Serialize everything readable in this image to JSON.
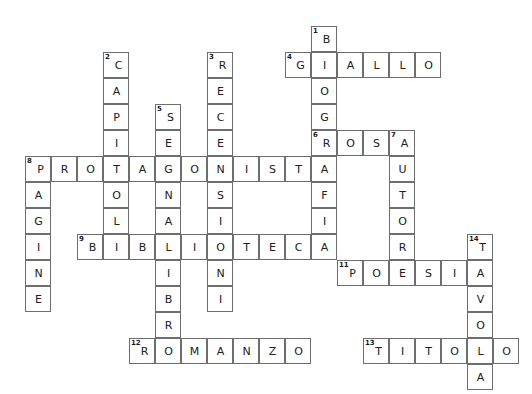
{
  "puzzle": {
    "kind": "crossword-grid",
    "title": "",
    "cell_size": 26,
    "origin_x": 25,
    "origin_y": 26,
    "cols": 19,
    "rows": 14,
    "colors": {
      "cell_background": "#ffffff",
      "cell_border": "#6e6e6e",
      "letter": "#202020",
      "clue_number": "#1a1a1a",
      "page_background": "#ffffff"
    },
    "entries": {
      "across": [
        {
          "number": "4",
          "answer": "GIALLO",
          "row": 1,
          "col": 10
        },
        {
          "number": "6",
          "answer": "ROSA",
          "row": 4,
          "col": 11
        },
        {
          "number": "8",
          "answer": "PROTAGONISTA",
          "row": 5,
          "col": 0
        },
        {
          "number": "9",
          "answer": "BIBLIOTECA",
          "row": 8,
          "col": 2
        },
        {
          "number": "11",
          "answer": "POESIA",
          "row": 9,
          "col": 12
        },
        {
          "number": "12",
          "answer": "ROMANZO",
          "row": 12,
          "col": 4
        },
        {
          "number": "13",
          "answer": "TITOLO",
          "row": 12,
          "col": 13
        }
      ],
      "down": [
        {
          "number": "1",
          "answer": "BIOGRAFIA",
          "row": 0,
          "col": 11
        },
        {
          "number": "2",
          "answer": "CAPITOLI",
          "row": 1,
          "col": 3
        },
        {
          "number": "3",
          "answer": "RECENSIONI",
          "row": 1,
          "col": 7
        },
        {
          "number": "5",
          "answer": "SEGNALIBRO",
          "row": 3,
          "col": 5
        },
        {
          "number": "7",
          "answer": "AUTORE",
          "row": 4,
          "col": 14
        },
        {
          "number": "8",
          "answer": "PAGINE",
          "row": 5,
          "col": 0
        },
        {
          "number": "14",
          "answer": "TAVOLA",
          "row": 8,
          "col": 17
        }
      ]
    },
    "cells": [
      {
        "row": 0,
        "col": 11,
        "letter": "B",
        "number": "1"
      },
      {
        "row": 1,
        "col": 3,
        "letter": "C",
        "number": "2"
      },
      {
        "row": 1,
        "col": 7,
        "letter": "R",
        "number": "3"
      },
      {
        "row": 1,
        "col": 10,
        "letter": "G",
        "number": "4"
      },
      {
        "row": 1,
        "col": 11,
        "letter": "I",
        "number": ""
      },
      {
        "row": 1,
        "col": 12,
        "letter": "A",
        "number": ""
      },
      {
        "row": 1,
        "col": 13,
        "letter": "L",
        "number": ""
      },
      {
        "row": 1,
        "col": 14,
        "letter": "L",
        "number": ""
      },
      {
        "row": 1,
        "col": 15,
        "letter": "O",
        "number": ""
      },
      {
        "row": 2,
        "col": 3,
        "letter": "A",
        "number": ""
      },
      {
        "row": 2,
        "col": 7,
        "letter": "E",
        "number": ""
      },
      {
        "row": 2,
        "col": 11,
        "letter": "O",
        "number": ""
      },
      {
        "row": 3,
        "col": 3,
        "letter": "P",
        "number": ""
      },
      {
        "row": 3,
        "col": 5,
        "letter": "S",
        "number": "5"
      },
      {
        "row": 3,
        "col": 7,
        "letter": "C",
        "number": ""
      },
      {
        "row": 3,
        "col": 11,
        "letter": "G",
        "number": ""
      },
      {
        "row": 4,
        "col": 3,
        "letter": "I",
        "number": ""
      },
      {
        "row": 4,
        "col": 5,
        "letter": "E",
        "number": ""
      },
      {
        "row": 4,
        "col": 7,
        "letter": "E",
        "number": ""
      },
      {
        "row": 4,
        "col": 11,
        "letter": "R",
        "number": "6"
      },
      {
        "row": 4,
        "col": 12,
        "letter": "O",
        "number": ""
      },
      {
        "row": 4,
        "col": 13,
        "letter": "S",
        "number": ""
      },
      {
        "row": 4,
        "col": 14,
        "letter": "A",
        "number": "7"
      },
      {
        "row": 5,
        "col": 0,
        "letter": "P",
        "number": "8"
      },
      {
        "row": 5,
        "col": 1,
        "letter": "R",
        "number": ""
      },
      {
        "row": 5,
        "col": 2,
        "letter": "O",
        "number": ""
      },
      {
        "row": 5,
        "col": 3,
        "letter": "T",
        "number": ""
      },
      {
        "row": 5,
        "col": 4,
        "letter": "A",
        "number": ""
      },
      {
        "row": 5,
        "col": 5,
        "letter": "G",
        "number": ""
      },
      {
        "row": 5,
        "col": 6,
        "letter": "O",
        "number": ""
      },
      {
        "row": 5,
        "col": 7,
        "letter": "N",
        "number": ""
      },
      {
        "row": 5,
        "col": 8,
        "letter": "I",
        "number": ""
      },
      {
        "row": 5,
        "col": 9,
        "letter": "S",
        "number": ""
      },
      {
        "row": 5,
        "col": 10,
        "letter": "T",
        "number": ""
      },
      {
        "row": 5,
        "col": 11,
        "letter": "A",
        "number": ""
      },
      {
        "row": 5,
        "col": 14,
        "letter": "U",
        "number": ""
      },
      {
        "row": 6,
        "col": 0,
        "letter": "A",
        "number": ""
      },
      {
        "row": 6,
        "col": 3,
        "letter": "O",
        "number": ""
      },
      {
        "row": 6,
        "col": 5,
        "letter": "N",
        "number": ""
      },
      {
        "row": 6,
        "col": 7,
        "letter": "S",
        "number": ""
      },
      {
        "row": 6,
        "col": 11,
        "letter": "F",
        "number": ""
      },
      {
        "row": 6,
        "col": 14,
        "letter": "T",
        "number": ""
      },
      {
        "row": 7,
        "col": 0,
        "letter": "G",
        "number": ""
      },
      {
        "row": 7,
        "col": 3,
        "letter": "L",
        "number": ""
      },
      {
        "row": 7,
        "col": 5,
        "letter": "A",
        "number": ""
      },
      {
        "row": 7,
        "col": 7,
        "letter": "I",
        "number": ""
      },
      {
        "row": 7,
        "col": 11,
        "letter": "I",
        "number": ""
      },
      {
        "row": 7,
        "col": 14,
        "letter": "O",
        "number": ""
      },
      {
        "row": 8,
        "col": 0,
        "letter": "I",
        "number": ""
      },
      {
        "row": 8,
        "col": 2,
        "letter": "B",
        "number": "9"
      },
      {
        "row": 8,
        "col": 3,
        "letter": "I",
        "number": ""
      },
      {
        "row": 8,
        "col": 4,
        "letter": "B",
        "number": ""
      },
      {
        "row": 8,
        "col": 5,
        "letter": "L",
        "number": ""
      },
      {
        "row": 8,
        "col": 6,
        "letter": "I",
        "number": ""
      },
      {
        "row": 8,
        "col": 7,
        "letter": "O",
        "number": ""
      },
      {
        "row": 8,
        "col": 8,
        "letter": "T",
        "number": ""
      },
      {
        "row": 8,
        "col": 9,
        "letter": "E",
        "number": ""
      },
      {
        "row": 8,
        "col": 10,
        "letter": "C",
        "number": ""
      },
      {
        "row": 8,
        "col": 11,
        "letter": "A",
        "number": ""
      },
      {
        "row": 8,
        "col": 14,
        "letter": "R",
        "number": ""
      },
      {
        "row": 8,
        "col": 17,
        "letter": "T",
        "number": "14"
      },
      {
        "row": 9,
        "col": 0,
        "letter": "N",
        "number": ""
      },
      {
        "row": 9,
        "col": 5,
        "letter": "I",
        "number": ""
      },
      {
        "row": 9,
        "col": 7,
        "letter": "N",
        "number": ""
      },
      {
        "row": 9,
        "col": 12,
        "letter": "P",
        "number": "11"
      },
      {
        "row": 9,
        "col": 13,
        "letter": "O",
        "number": ""
      },
      {
        "row": 9,
        "col": 14,
        "letter": "E",
        "number": ""
      },
      {
        "row": 9,
        "col": 15,
        "letter": "S",
        "number": ""
      },
      {
        "row": 9,
        "col": 16,
        "letter": "I",
        "number": ""
      },
      {
        "row": 9,
        "col": 17,
        "letter": "A",
        "number": ""
      },
      {
        "row": 10,
        "col": 0,
        "letter": "E",
        "number": ""
      },
      {
        "row": 10,
        "col": 5,
        "letter": "B",
        "number": ""
      },
      {
        "row": 10,
        "col": 7,
        "letter": "I",
        "number": ""
      },
      {
        "row": 10,
        "col": 17,
        "letter": "V",
        "number": ""
      },
      {
        "row": 11,
        "col": 5,
        "letter": "R",
        "number": ""
      },
      {
        "row": 11,
        "col": 17,
        "letter": "O",
        "number": ""
      },
      {
        "row": 12,
        "col": 4,
        "letter": "R",
        "number": "12"
      },
      {
        "row": 12,
        "col": 5,
        "letter": "O",
        "number": ""
      },
      {
        "row": 12,
        "col": 6,
        "letter": "M",
        "number": ""
      },
      {
        "row": 12,
        "col": 7,
        "letter": "A",
        "number": ""
      },
      {
        "row": 12,
        "col": 8,
        "letter": "N",
        "number": ""
      },
      {
        "row": 12,
        "col": 9,
        "letter": "Z",
        "number": ""
      },
      {
        "row": 12,
        "col": 10,
        "letter": "O",
        "number": ""
      },
      {
        "row": 12,
        "col": 13,
        "letter": "T",
        "number": "13"
      },
      {
        "row": 12,
        "col": 14,
        "letter": "I",
        "number": ""
      },
      {
        "row": 12,
        "col": 15,
        "letter": "T",
        "number": ""
      },
      {
        "row": 12,
        "col": 16,
        "letter": "O",
        "number": ""
      },
      {
        "row": 12,
        "col": 17,
        "letter": "L",
        "number": ""
      },
      {
        "row": 12,
        "col": 18,
        "letter": "O",
        "number": ""
      },
      {
        "row": 13,
        "col": 17,
        "letter": "A",
        "number": ""
      }
    ]
  }
}
